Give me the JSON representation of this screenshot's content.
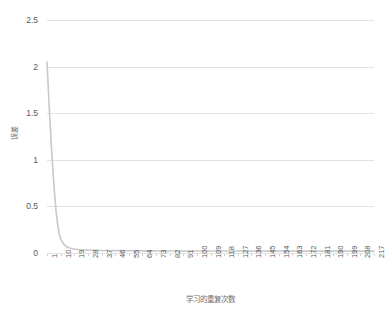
{
  "chart_data": {
    "type": "line",
    "title": "",
    "xlabel": "学习的重复次数",
    "ylabel": "误差",
    "xlim": [
      1,
      217
    ],
    "ylim": [
      0,
      2.5
    ],
    "grid": "horizontal",
    "legend": "none",
    "y_ticks": [
      "0",
      "0.5",
      "1",
      "1.5",
      "2",
      "2.5"
    ],
    "y_tick_values": [
      0,
      0.5,
      1,
      1.5,
      2,
      2.5
    ],
    "x_ticks": [
      "1",
      "10",
      "19",
      "28",
      "37",
      "46",
      "55",
      "64",
      "73",
      "82",
      "91",
      "100",
      "109",
      "118",
      "127",
      "136",
      "145",
      "154",
      "163",
      "172",
      "181",
      "190",
      "199",
      "208",
      "217"
    ],
    "x_tick_values": [
      1,
      10,
      19,
      28,
      37,
      46,
      55,
      64,
      73,
      82,
      91,
      100,
      109,
      118,
      127,
      136,
      145,
      154,
      163,
      172,
      181,
      190,
      199,
      208,
      217
    ],
    "series": [
      {
        "name": "误差",
        "color": "#c9c9c9",
        "x": [
          1,
          2,
          3,
          4,
          5,
          6,
          7,
          8,
          9,
          10,
          12,
          14,
          16,
          19,
          23,
          28,
          37,
          46,
          55,
          64,
          82,
          100,
          127,
          154,
          181,
          199,
          217
        ],
        "values": [
          2.05,
          1.72,
          1.41,
          1.12,
          0.86,
          0.63,
          0.45,
          0.31,
          0.21,
          0.15,
          0.095,
          0.068,
          0.053,
          0.042,
          0.035,
          0.031,
          0.027,
          0.025,
          0.024,
          0.023,
          0.022,
          0.021,
          0.021,
          0.02,
          0.02,
          0.02,
          0.02
        ]
      }
    ]
  }
}
